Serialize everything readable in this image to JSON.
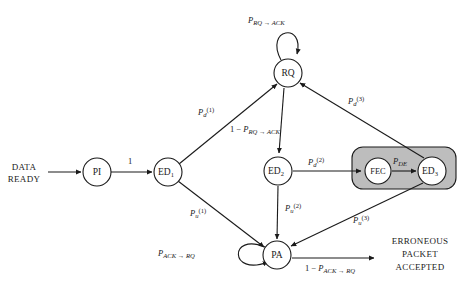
{
  "diagram": {
    "background_color": "#ffffff",
    "line_color": "#1a1a1a",
    "highlight_color": "#bdbdbd",
    "nodes": [
      {
        "id": "PI",
        "label": "PI",
        "sub": "",
        "cx": 97,
        "cy": 172,
        "r": 14
      },
      {
        "id": "ED1",
        "label": "ED",
        "sub": "1",
        "cx": 168,
        "cy": 172,
        "r": 14
      },
      {
        "id": "RQ",
        "label": "RQ",
        "sub": "",
        "cx": 288,
        "cy": 73,
        "r": 14
      },
      {
        "id": "ED2",
        "label": "ED",
        "sub": "2",
        "cx": 278,
        "cy": 171,
        "r": 14
      },
      {
        "id": "FEC",
        "label": "FEC",
        "sub": "",
        "cx": 378,
        "cy": 171,
        "r": 13
      },
      {
        "id": "ED3",
        "label": "ED",
        "sub": "3",
        "cx": 432,
        "cy": 171,
        "r": 14
      },
      {
        "id": "PA",
        "label": "PA",
        "sub": "",
        "cx": 277,
        "cy": 255,
        "r": 14
      }
    ],
    "text_blocks": {
      "data_ready_line1": "DATA",
      "data_ready_line2": "READY",
      "erroneous_line1": "ERRONEOUS",
      "erroneous_line2": "PACKET",
      "erroneous_line3": "ACCEPTED"
    },
    "edge_labels": {
      "pi_to_ed1": "1",
      "ed1_to_rq": {
        "base": "P",
        "sub": "d",
        "sup": "(1)"
      },
      "ed1_to_pa": {
        "base": "P",
        "sub": "u",
        "sup": "(1)"
      },
      "rq_self_loop": {
        "base": "P",
        "sub": "RQ → ACK"
      },
      "rq_to_ed2": {
        "prefix": "1 − ",
        "base": "P",
        "sub": "RQ → ACK"
      },
      "ed2_to_fec": {
        "base": "P",
        "sub": "d",
        "sup": "(2)"
      },
      "fec_to_ed3": {
        "base": "P",
        "sub": "DE"
      },
      "ed2_to_pa": {
        "base": "P",
        "sub": "u",
        "sup": "(2)"
      },
      "ed3_to_rq": {
        "base": "P",
        "sub": "d",
        "sup": "(3)"
      },
      "ed3_to_pa": {
        "base": "P",
        "sub": "u",
        "sup": "(3)"
      },
      "pa_self_loop": {
        "base": "P",
        "sub": "ACK → RQ"
      },
      "pa_to_accepted": {
        "prefix": "1 − ",
        "base": "P",
        "sub": "ACK → RQ"
      }
    },
    "highlight_region": {
      "name": "fec-ed3-group",
      "x": 352,
      "y": 147,
      "width": 104,
      "height": 42,
      "rx": 11
    }
  }
}
